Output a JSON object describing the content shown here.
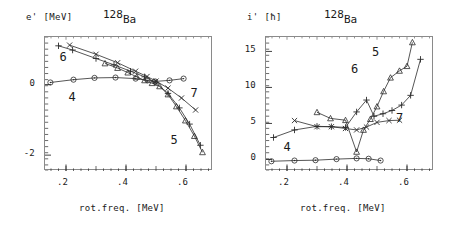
{
  "figure": {
    "nucleus_mass": "128",
    "nucleus_symbol": "Ba",
    "xlabel": "rot.freq. [MeV]"
  },
  "chart_data": [
    {
      "type": "line",
      "panel": "left",
      "title": "128Ba",
      "xlabel": "rot.freq. [MeV]",
      "ylabel": "e' [MeV]",
      "xlim": [
        0.13,
        0.69
      ],
      "ylim": [
        -2.45,
        1.35
      ],
      "xticks": [
        0.2,
        0.4,
        0.6
      ],
      "xticklabels": [
        ".2",
        ".4",
        ".6"
      ],
      "yticks": [
        0,
        -2
      ],
      "yticklabels": [
        "0",
        "-2"
      ],
      "grid": false,
      "legend": "inline-curve-numbers",
      "series": [
        {
          "name": "4",
          "marker": "circle",
          "label_x": 0.225,
          "label_y": -0.42,
          "x": [
            0.148,
            0.225,
            0.295,
            0.365,
            0.432,
            0.472,
            0.497,
            0.545,
            0.592
          ],
          "y": [
            0.06,
            0.14,
            0.19,
            0.2,
            0.17,
            0.12,
            0.09,
            0.12,
            0.17
          ]
        },
        {
          "name": "5",
          "marker": "triangle",
          "label_x": 0.565,
          "label_y": -1.62,
          "x": [
            0.33,
            0.372,
            0.406,
            0.436,
            0.462,
            0.487,
            0.512,
            0.54,
            0.568,
            0.598,
            0.628,
            0.655
          ],
          "y": [
            0.6,
            0.47,
            0.34,
            0.22,
            0.12,
            0.04,
            -0.05,
            -0.28,
            -0.62,
            -1.02,
            -1.46,
            -1.92
          ]
        },
        {
          "name": "6",
          "marker": "plus",
          "label_x": 0.195,
          "label_y": 0.72,
          "x": [
            0.175,
            0.222,
            0.3,
            0.36,
            0.415,
            0.462,
            0.5,
            0.54,
            0.578,
            0.612,
            0.648
          ],
          "y": [
            1.1,
            0.98,
            0.74,
            0.56,
            0.38,
            0.22,
            0.05,
            -0.25,
            -0.66,
            -1.12,
            -1.72
          ]
        },
        {
          "name": "7",
          "marker": "cross",
          "label_x": 0.632,
          "label_y": -0.3,
          "x": [
            0.212,
            0.3,
            0.372,
            0.432,
            0.47,
            0.5,
            0.54,
            0.585,
            0.632
          ],
          "y": [
            1.12,
            0.86,
            0.62,
            0.38,
            0.23,
            0.1,
            -0.1,
            -0.38,
            -0.72
          ]
        }
      ]
    },
    {
      "type": "line",
      "panel": "right",
      "title": "128Ba",
      "xlabel": "rot.freq. [MeV]",
      "ylabel": "i' [ħ]",
      "xlim": [
        0.13,
        0.69
      ],
      "ylim": [
        -1.6,
        17.0
      ],
      "xticks": [
        0.2,
        0.4,
        0.6
      ],
      "xticklabels": [
        ".2",
        ".4",
        ".6"
      ],
      "yticks": [
        0,
        5,
        10,
        15
      ],
      "yticklabels": [
        "0",
        "5",
        "10",
        "15"
      ],
      "grid": false,
      "legend": "inline-curve-numbers",
      "series": [
        {
          "name": "4",
          "marker": "circle",
          "label_x": 0.205,
          "label_y": 1.45,
          "x": [
            0.148,
            0.225,
            0.295,
            0.365,
            0.432,
            0.472,
            0.512
          ],
          "y": [
            -0.25,
            -0.15,
            -0.1,
            0.05,
            0.15,
            0.1,
            -0.15
          ]
        },
        {
          "name": "5",
          "marker": "triangle",
          "label_x": 0.5,
          "label_y": 14.6,
          "x": [
            0.3,
            0.345,
            0.395,
            0.432,
            0.455,
            0.478,
            0.5,
            0.522,
            0.545,
            0.575,
            0.6,
            0.618
          ],
          "y": [
            6.55,
            5.7,
            5.45,
            1.05,
            4.1,
            5.6,
            7.35,
            9.45,
            11.35,
            12.3,
            12.95,
            16.25
          ]
        },
        {
          "name": "6",
          "marker": "plus",
          "label_x": 0.43,
          "label_y": 12.3,
          "x": [
            0.155,
            0.225,
            0.3,
            0.348,
            0.395,
            0.432,
            0.465,
            0.49,
            0.52,
            0.55,
            0.582,
            0.612,
            0.645
          ],
          "y": [
            3.05,
            4.1,
            4.6,
            4.55,
            4.45,
            6.6,
            8.25,
            6.0,
            6.35,
            6.8,
            7.55,
            8.9,
            13.9
          ]
        },
        {
          "name": "7",
          "marker": "cross",
          "label_x": 0.58,
          "label_y": 5.45,
          "x": [
            0.225,
            0.3,
            0.348,
            0.395,
            0.432,
            0.465,
            0.5,
            0.54,
            0.575
          ],
          "y": [
            5.4,
            4.55,
            4.55,
            4.3,
            4.1,
            4.5,
            5.15,
            5.4,
            5.45
          ]
        }
      ]
    }
  ]
}
